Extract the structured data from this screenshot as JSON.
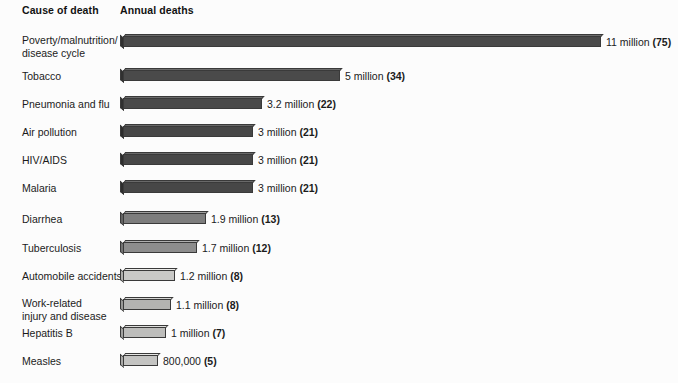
{
  "header": {
    "cause_column": "Cause of death",
    "deaths_column": "Annual deaths"
  },
  "chart_data": {
    "type": "bar",
    "orientation": "horizontal",
    "title": "",
    "subtitle": "",
    "xlabel": "Annual deaths",
    "ylabel": "Cause of death",
    "grid": false,
    "legend": "none",
    "xlim": [
      0,
      11
    ],
    "units": "millions of deaths per year",
    "note": "Number in parentheses after each label is the percent-of-total style index shown on the chart",
    "categories": [
      "Poverty/malnutrition/\ndisease cycle",
      "Tobacco",
      "Pneumonia and flu",
      "Air pollution",
      "HIV/AIDS",
      "Malaria",
      "Diarrhea",
      "Tuberculosis",
      "Automobile accidents",
      "Work-related\ninjury and disease",
      "Hepatitis B",
      "Measles"
    ],
    "values": [
      11,
      5,
      3.2,
      3,
      3,
      3,
      1.9,
      1.7,
      1.2,
      1.1,
      1,
      0.8
    ],
    "parenthetical": [
      75,
      34,
      22,
      21,
      21,
      21,
      13,
      12,
      8,
      8,
      7,
      5
    ],
    "value_labels": [
      "11 million (75)",
      "5 million (34)",
      "3.2 million (22)",
      "3 million (21)",
      "3 million (21)",
      "3 million (21)",
      "1.9 million (13)",
      "1.7 million (12)",
      "1.2 million (8)",
      "1.1 million (8)",
      "1 million (7)",
      "800,000 (5)"
    ],
    "bar_colors": [
      "#4a4a4a",
      "#4a4a4a",
      "#4a4a4a",
      "#474747",
      "#474747",
      "#474747",
      "#7d7d7d",
      "#8d8d8d",
      "#c9c9c7",
      "#b3b3b1",
      "#bdbdbb",
      "#c4c4c2"
    ]
  }
}
